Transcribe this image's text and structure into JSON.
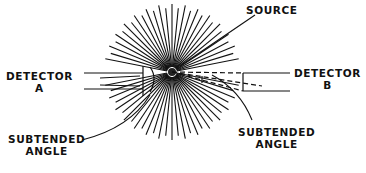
{
  "diagram": {
    "labels": {
      "source": "SOURCE",
      "detector_a": [
        "DETECTOR",
        "A"
      ],
      "detector_b": [
        "DETECTOR",
        "B"
      ],
      "subtended_angle_left": [
        "SUBTENDED",
        "ANGLE"
      ],
      "subtended_angle_right": [
        "SUBTENDED",
        "ANGLE"
      ]
    },
    "colors": {
      "ink": "#111111",
      "paper": "#ffffff"
    }
  }
}
